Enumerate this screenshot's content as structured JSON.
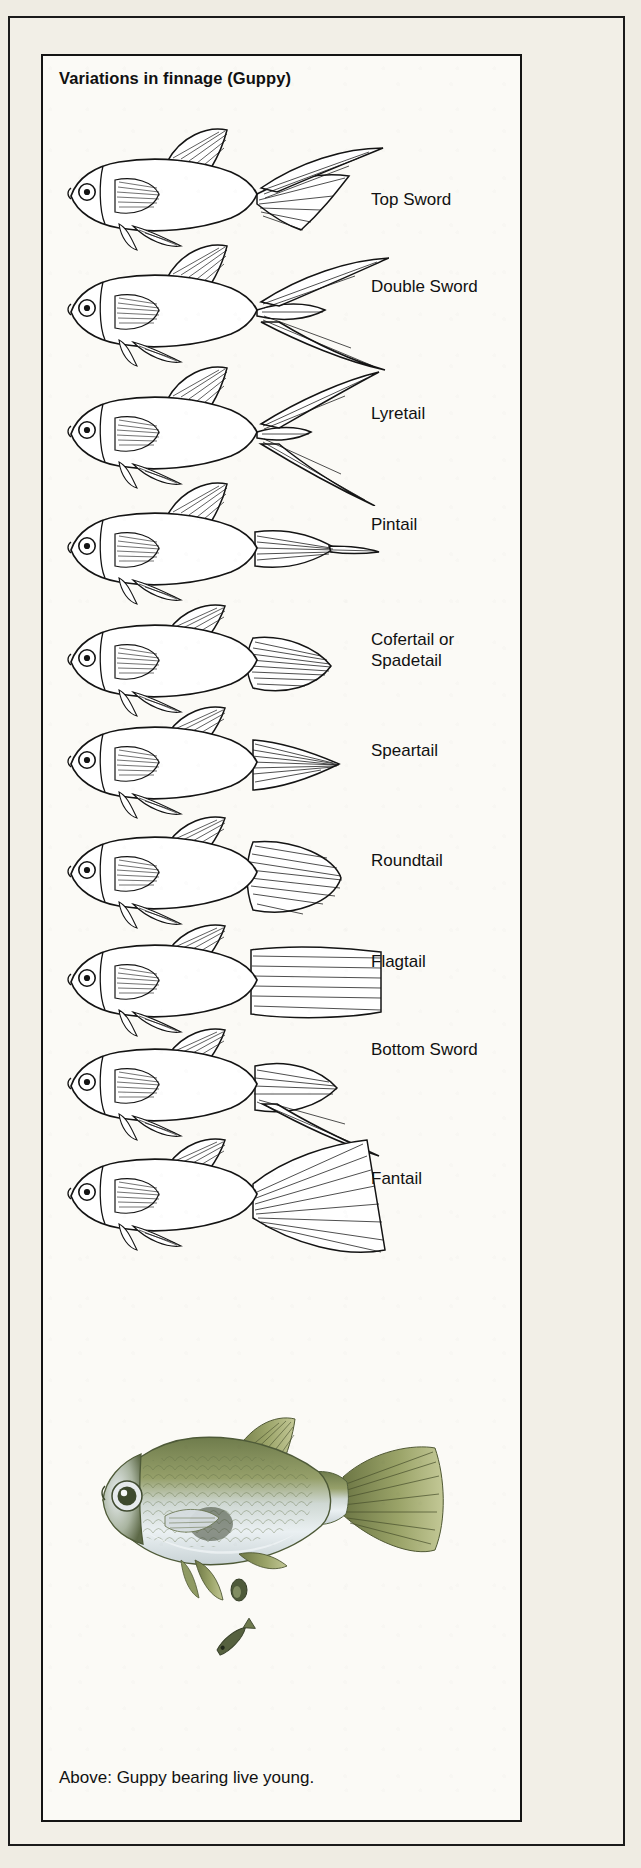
{
  "plate": {
    "title": "Variations in finnage (Guppy)",
    "caption": "Above: Guppy bearing live young."
  },
  "colors": {
    "page_background": "#efece3",
    "plate_background": "#fbfaf6",
    "ink": "#141414",
    "photo_body_green": "#7f8a58",
    "photo_body_silver": "#dfe4e6",
    "photo_fin_olive": "#8b9356"
  },
  "variations": [
    {
      "label": "Top Sword",
      "tail": "top-sword"
    },
    {
      "label": "Double Sword",
      "tail": "double-sword"
    },
    {
      "label": "Lyretail",
      "tail": "lyretail"
    },
    {
      "label": "Pintail",
      "tail": "pintail"
    },
    {
      "label": "Cofertail or\nSpadetail",
      "tail": "cofertail"
    },
    {
      "label": "Speartail",
      "tail": "speartail"
    },
    {
      "label": "Roundtail",
      "tail": "roundtail"
    },
    {
      "label": "Flagtail",
      "tail": "flagtail"
    },
    {
      "label": "Bottom Sword",
      "tail": "bottom-sword"
    },
    {
      "label": "Fantail",
      "tail": "fantail"
    }
  ],
  "photo": {
    "subject": "adult guppy with two live young",
    "alt": "Colour photograph of a female guppy and two newborn fry"
  }
}
